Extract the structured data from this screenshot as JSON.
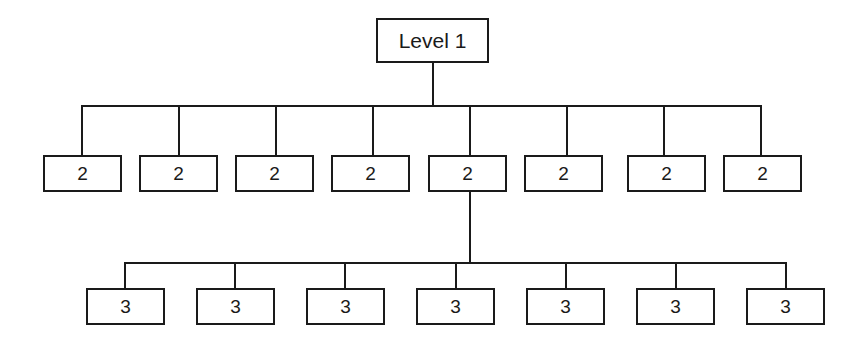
{
  "diagram": {
    "type": "tree",
    "background_color": "#ffffff",
    "line_color": "#1a1a1a",
    "box_fill_color": "#ffffff",
    "levels": [
      {
        "level": 1,
        "node_count": 1,
        "nodes": [
          {
            "label": "Level 1",
            "x": 376,
            "y": 18,
            "w": 113,
            "h": 45
          }
        ]
      },
      {
        "level": 2,
        "node_count": 8,
        "nodes": [
          {
            "label": "2",
            "x": 43,
            "y": 155,
            "w": 79,
            "h": 37
          },
          {
            "label": "2",
            "x": 139,
            "y": 155,
            "w": 79,
            "h": 37
          },
          {
            "label": "2",
            "x": 235,
            "y": 155,
            "w": 79,
            "h": 37
          },
          {
            "label": "2",
            "x": 331,
            "y": 155,
            "w": 79,
            "h": 37
          },
          {
            "label": "2",
            "x": 428,
            "y": 155,
            "w": 79,
            "h": 37
          },
          {
            "label": "2",
            "x": 524,
            "y": 155,
            "w": 79,
            "h": 37
          },
          {
            "label": "2",
            "x": 627,
            "y": 155,
            "w": 79,
            "h": 37
          },
          {
            "label": "2",
            "x": 723,
            "y": 155,
            "w": 79,
            "h": 37
          }
        ]
      },
      {
        "level": 3,
        "node_count": 7,
        "nodes": [
          {
            "label": "3",
            "x": 86,
            "y": 288,
            "w": 79,
            "h": 37
          },
          {
            "label": "3",
            "x": 196,
            "y": 288,
            "w": 79,
            "h": 37
          },
          {
            "label": "3",
            "x": 306,
            "y": 288,
            "w": 79,
            "h": 37
          },
          {
            "label": "3",
            "x": 416,
            "y": 288,
            "w": 79,
            "h": 37
          },
          {
            "label": "3",
            "x": 526,
            "y": 288,
            "w": 79,
            "h": 37
          },
          {
            "label": "3",
            "x": 636,
            "y": 288,
            "w": 79,
            "h": 37
          },
          {
            "label": "3",
            "x": 746,
            "y": 288,
            "w": 79,
            "h": 37
          }
        ]
      }
    ],
    "connectors": {
      "root_stem": {
        "x": 432,
        "y_top": 63,
        "y_bottom": 105
      },
      "level2_bus": {
        "y": 105,
        "x_left": 81,
        "x_right": 760
      },
      "level2_drops": [
        {
          "x": 81,
          "y_top": 105,
          "y_bottom": 155
        },
        {
          "x": 178,
          "y_top": 105,
          "y_bottom": 155
        },
        {
          "x": 275,
          "y_top": 105,
          "y_bottom": 155
        },
        {
          "x": 372,
          "y_top": 105,
          "y_bottom": 155
        },
        {
          "x": 469,
          "y_top": 105,
          "y_bottom": 155
        },
        {
          "x": 566,
          "y_top": 105,
          "y_bottom": 155
        },
        {
          "x": 663,
          "y_top": 105,
          "y_bottom": 155
        },
        {
          "x": 760,
          "y_top": 105,
          "y_bottom": 155
        }
      ],
      "level3_stem": {
        "x": 469,
        "y_top": 192,
        "y_bottom": 262,
        "from_parent_index": 4
      },
      "level3_bus": {
        "y": 262,
        "x_left": 124,
        "x_right": 785
      },
      "level3_drops": [
        {
          "x": 124,
          "y_top": 262,
          "y_bottom": 288
        },
        {
          "x": 234,
          "y_top": 262,
          "y_bottom": 288
        },
        {
          "x": 344,
          "y_top": 262,
          "y_bottom": 288
        },
        {
          "x": 455,
          "y_top": 262,
          "y_bottom": 288
        },
        {
          "x": 565,
          "y_top": 262,
          "y_bottom": 288
        },
        {
          "x": 675,
          "y_top": 262,
          "y_bottom": 288
        },
        {
          "x": 785,
          "y_top": 262,
          "y_bottom": 288
        }
      ]
    }
  }
}
